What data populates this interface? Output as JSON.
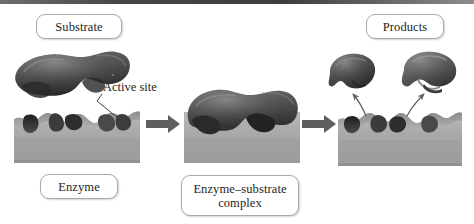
{
  "figure": {
    "type": "diagram",
    "style": "grayscale 3D rendered biology illustration",
    "background_color": "#ffffff",
    "top_rule_color": "#474644"
  },
  "labels": {
    "substrate": "Substrate",
    "active_site": "Active site",
    "enzyme": "Enzyme",
    "enzyme_substrate_complex_line1": "Enzyme–substrate",
    "enzyme_substrate_complex_line2": "complex",
    "products": "Products"
  },
  "stages": [
    {
      "name": "binding",
      "caption_top": "Substrate",
      "caption_bottom": "Enzyme",
      "annotation": "Active site",
      "shapes": [
        "substrate-blob",
        "enzyme-block"
      ]
    },
    {
      "name": "complex",
      "caption_bottom": "Enzyme–substrate complex",
      "shapes": [
        "enzyme-substrate-complex"
      ]
    },
    {
      "name": "release",
      "caption_top": "Products",
      "shapes": [
        "product-blob-left",
        "product-blob-right",
        "enzyme-block-empty"
      ]
    }
  ],
  "arrows": {
    "block_arrow_1": "right-arrow",
    "block_arrow_2": "right-arrow",
    "release_arrow_left": "curved-up-left-arrow",
    "release_arrow_right": "curved-up-right-arrow",
    "leader_line": "active-site-pointer",
    "color": "#5a5a5a"
  },
  "colors": {
    "substrate_dark": "#4a4a4a",
    "substrate_mid": "#6e6e6e",
    "enzyme_body": "#aeaeae",
    "enzyme_top": "#8c8c8c",
    "enzyme_shadow": "#2e2e2e",
    "label_border": "#a9a9a9",
    "text": "#231f1c"
  }
}
